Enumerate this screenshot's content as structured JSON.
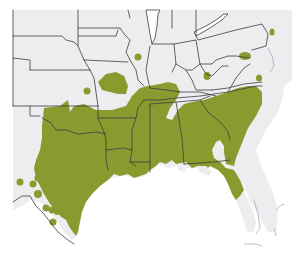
{
  "map": {
    "type": "species-range-map",
    "region": "Southeastern and South-Central United States",
    "legend": [],
    "colors": {
      "range_fill": "#8a9a2e",
      "land_fill": "#ecedee",
      "water_fill": "#ffffff",
      "state_border": "#3a3d40",
      "coast_line": "#8a93a8"
    },
    "range_areas": [
      "Texas (central and east), Oklahoma (south-east)",
      "Arkansas, Louisiana, Mississippi, Alabama, Georgia",
      "Tennessee, Kentucky (south-west), southern Illinois/Indiana",
      "South Carolina, North Carolina (central/east), Virginia (south)",
      "Northern Florida",
      "Missouri (central isolated patch)",
      "Isolated spots: Kansas, Iowa/Illinois, West Virginia/Ohio, Maryland, Virginia coast, New Jersey, west Texas"
    ]
  }
}
